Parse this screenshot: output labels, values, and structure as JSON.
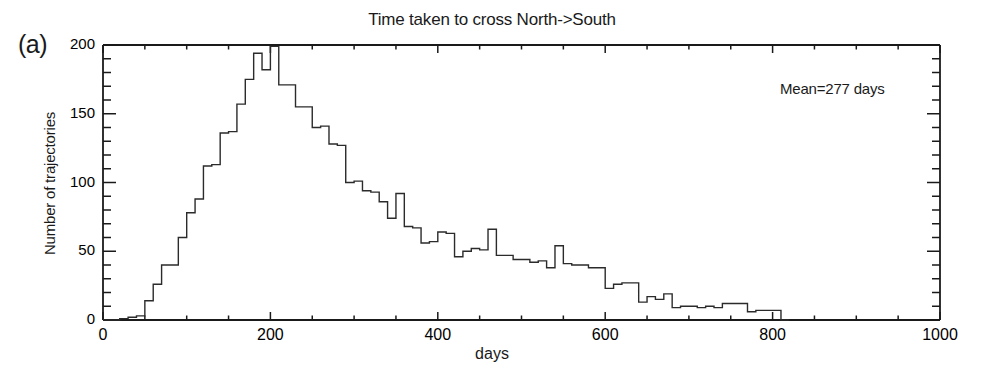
{
  "chart_data": {
    "type": "bar",
    "subtype": "histogram-step",
    "title": "Time taken to cross  North->South",
    "panel_label": "(a)",
    "xlabel": "days",
    "ylabel": "Number of trajectories",
    "xlim": [
      0,
      1000
    ],
    "ylim": [
      0,
      200
    ],
    "xticks": [
      0,
      200,
      400,
      600,
      800,
      1000
    ],
    "xtick_labels": [
      "0",
      "200",
      "400",
      "600",
      "800",
      "1000"
    ],
    "yticks": [
      0,
      50,
      100,
      150,
      200
    ],
    "ytick_labels": [
      "0",
      "50",
      "100",
      "150",
      "200"
    ],
    "x_minor_tick_interval": 50,
    "y_minor_tick_interval": 10,
    "grid": false,
    "legend": null,
    "annotations": [
      {
        "text": "Mean=277 days",
        "x": 700,
        "y": 180
      }
    ],
    "bin_width": 10,
    "bin_starts": [
      0,
      10,
      20,
      30,
      40,
      50,
      60,
      70,
      80,
      90,
      100,
      110,
      120,
      130,
      140,
      150,
      160,
      170,
      180,
      190,
      200,
      210,
      220,
      230,
      240,
      250,
      260,
      270,
      280,
      290,
      300,
      310,
      320,
      330,
      340,
      350,
      360,
      370,
      380,
      390,
      400,
      410,
      420,
      430,
      440,
      450,
      460,
      470,
      480,
      490,
      500,
      510,
      520,
      530,
      540,
      550,
      560,
      570,
      580,
      590,
      600,
      610,
      620,
      630,
      640,
      650,
      660,
      670,
      680,
      690,
      700,
      710,
      720,
      730,
      740,
      750,
      760,
      770,
      780,
      790,
      800,
      810
    ],
    "values": [
      0,
      0,
      1,
      2,
      3,
      14,
      26,
      40,
      40,
      60,
      78,
      88,
      112,
      113,
      136,
      137,
      157,
      175,
      194,
      182,
      199,
      171,
      171,
      155,
      155,
      140,
      141,
      128,
      127,
      100,
      101,
      94,
      93,
      86,
      74,
      92,
      68,
      67,
      56,
      57,
      64,
      63,
      46,
      50,
      52,
      51,
      66,
      47,
      47,
      44,
      44,
      42,
      43,
      38,
      54,
      41,
      40,
      40,
      38,
      38,
      23,
      26,
      27,
      27,
      13,
      17,
      15,
      19,
      9,
      10,
      10,
      9,
      10,
      9,
      12,
      12,
      12,
      6,
      7,
      7,
      7,
      0
    ],
    "line_color": "#2b2b2b",
    "axis_color": "#1a1a1a",
    "background_color": "#ffffff"
  },
  "plot_geometry": {
    "left": 103,
    "right": 940,
    "top": 45,
    "bottom": 320
  }
}
